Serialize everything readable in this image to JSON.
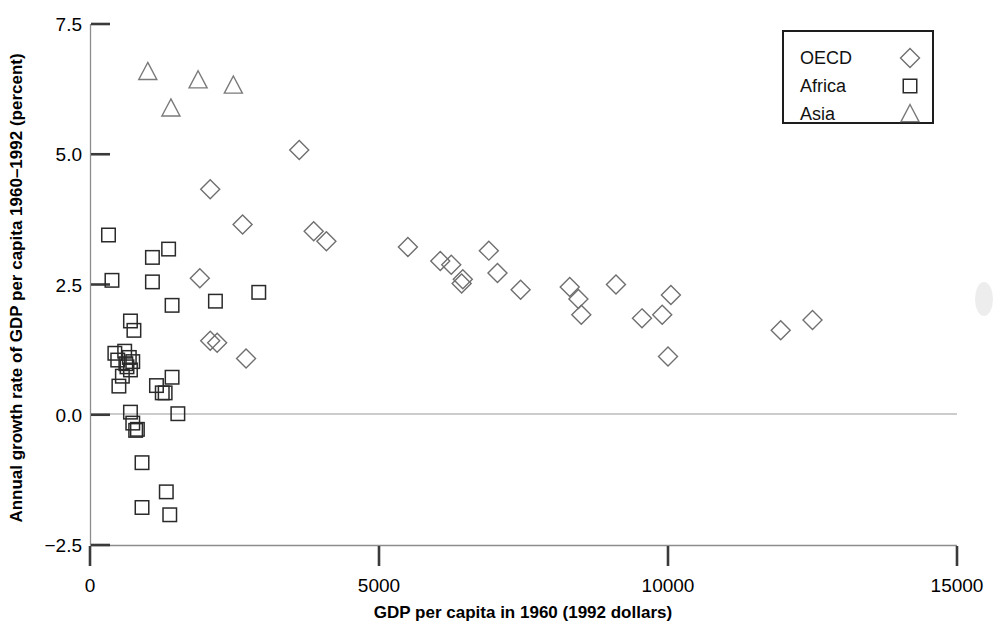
{
  "chart_data": {
    "type": "scatter",
    "title": "",
    "xlabel": "GDP per capita in 1960 (1992 dollars)",
    "ylabel": "Annual growth rate of GDP per capita 1960–1992 (percent)",
    "xlim": [
      0,
      15000
    ],
    "ylim": [
      -2.5,
      7.5
    ],
    "xticks": [
      0,
      5000,
      10000,
      15000
    ],
    "xticklabels": [
      "0",
      "5000",
      "10000",
      "15000"
    ],
    "yticks": [
      -2.5,
      0.0,
      2.5,
      5.0,
      7.5
    ],
    "yticklabels": [
      "−2.5",
      "0.0",
      "2.5",
      "5.0",
      "7.5"
    ],
    "grid": false,
    "zero_reference_line": true,
    "legend_position": "top-right",
    "series": [
      {
        "name": "OECD",
        "marker": "diamond",
        "points": [
          [
            3620,
            5.08
          ],
          [
            2080,
            4.33
          ],
          [
            2640,
            3.65
          ],
          [
            3870,
            3.52
          ],
          [
            4090,
            3.33
          ],
          [
            5500,
            3.22
          ],
          [
            6060,
            2.95
          ],
          [
            6250,
            2.88
          ],
          [
            6900,
            3.15
          ],
          [
            6450,
            2.6
          ],
          [
            6430,
            2.52
          ],
          [
            7050,
            2.72
          ],
          [
            7450,
            2.4
          ],
          [
            8300,
            2.45
          ],
          [
            8450,
            2.22
          ],
          [
            8500,
            1.92
          ],
          [
            9100,
            2.5
          ],
          [
            9550,
            1.85
          ],
          [
            9900,
            1.92
          ],
          [
            10050,
            2.3
          ],
          [
            10000,
            1.12
          ],
          [
            11950,
            1.62
          ],
          [
            12500,
            1.82
          ],
          [
            1900,
            2.62
          ],
          [
            2080,
            1.42
          ],
          [
            2200,
            1.38
          ],
          [
            2700,
            1.08
          ]
        ]
      },
      {
        "name": "Africa",
        "marker": "square",
        "points": [
          [
            320,
            3.45
          ],
          [
            1080,
            3.02
          ],
          [
            1360,
            3.18
          ],
          [
            380,
            2.58
          ],
          [
            1080,
            2.55
          ],
          [
            1420,
            2.1
          ],
          [
            2170,
            2.18
          ],
          [
            2920,
            2.35
          ],
          [
            700,
            1.8
          ],
          [
            760,
            1.62
          ],
          [
            430,
            1.18
          ],
          [
            480,
            1.05
          ],
          [
            600,
            1.22
          ],
          [
            620,
            0.98
          ],
          [
            640,
            0.92
          ],
          [
            680,
            1.1
          ],
          [
            700,
            0.86
          ],
          [
            740,
            1.02
          ],
          [
            560,
            0.74
          ],
          [
            500,
            0.55
          ],
          [
            1150,
            0.56
          ],
          [
            1250,
            0.42
          ],
          [
            1300,
            0.42
          ],
          [
            1420,
            0.72
          ],
          [
            700,
            0.05
          ],
          [
            1520,
            0.02
          ],
          [
            740,
            -0.16
          ],
          [
            790,
            -0.3
          ],
          [
            820,
            -0.28
          ],
          [
            900,
            -0.92
          ],
          [
            1320,
            -1.48
          ],
          [
            900,
            -1.78
          ],
          [
            1380,
            -1.92
          ]
        ]
      },
      {
        "name": "Asia",
        "marker": "triangle",
        "points": [
          [
            1000,
            6.58
          ],
          [
            1870,
            6.42
          ],
          [
            2480,
            6.32
          ],
          [
            1400,
            5.88
          ]
        ]
      }
    ]
  },
  "legend": {
    "entries": [
      {
        "label": "OECD",
        "marker": "diamond"
      },
      {
        "label": "Africa",
        "marker": "square"
      },
      {
        "label": "Asia",
        "marker": "triangle"
      }
    ]
  }
}
